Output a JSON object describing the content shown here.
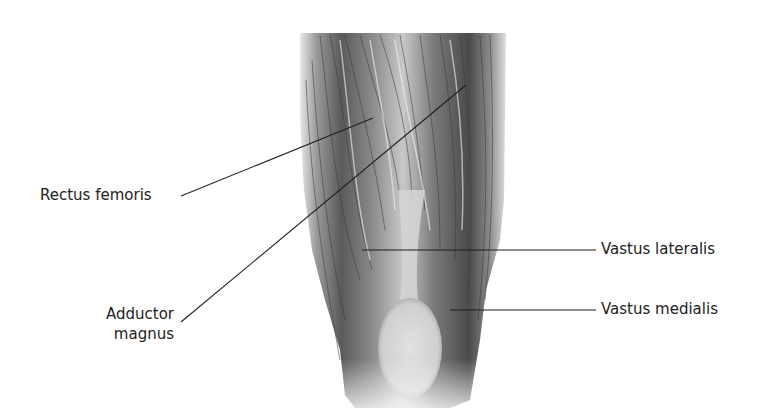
{
  "figure": {
    "line_color": "#1f1f1f",
    "text_color": "#222222"
  },
  "labels": [
    {
      "id": "rectus-femoris",
      "text": "Rectus femoris",
      "side": "left"
    },
    {
      "id": "adductor-magnus",
      "line1": "Adductor",
      "line2": "magnus",
      "side": "left"
    },
    {
      "id": "vastus-lateralis",
      "text": "Vastus lateralis",
      "side": "right"
    },
    {
      "id": "vastus-medialis",
      "text": "Vastus medialis",
      "side": "right"
    }
  ]
}
